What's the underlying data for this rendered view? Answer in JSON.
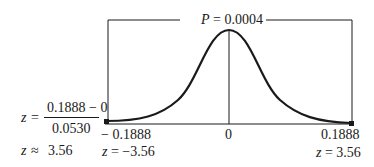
{
  "diagram": {
    "type": "normal-curve-two-tailed",
    "probability_label": {
      "var": "P",
      "eq": "= 0.0004"
    },
    "axis_labels": {
      "left": "− 0.1888",
      "center": "0",
      "right": "0.1888"
    },
    "z_labels": {
      "left": {
        "var": "z",
        "eq": "= −3.56"
      },
      "right": {
        "var": "z",
        "eq": "= 3.56"
      }
    },
    "formula": {
      "lhs_var": "z",
      "lhs_eq": "=",
      "numerator": "0.1888 − 0",
      "denominator": "0.0530",
      "result_var": "z",
      "result_eq": "≈",
      "result_value": "3.56"
    },
    "colors": {
      "ink": "#1a1a1a",
      "background": "#ffffff"
    }
  }
}
